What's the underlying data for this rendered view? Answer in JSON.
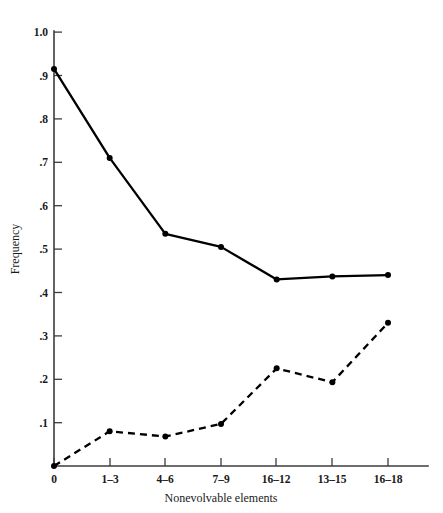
{
  "chart_data": {
    "type": "line",
    "title": "",
    "xlabel": "Nonevolvable elements",
    "ylabel": "Frequency",
    "categories": [
      "0",
      "1–3",
      "4–6",
      "7–9",
      "16–12",
      "13–15",
      "16–18"
    ],
    "x_tick_labels": [
      "0",
      "1–3",
      "4–6",
      "7–9",
      "16–12",
      "13–15",
      "16–18"
    ],
    "y_tick_labels": [
      "1.0",
      ".9",
      ".8",
      ".7",
      ".6",
      ".5",
      ".4",
      ".3",
      ".2",
      ".1"
    ],
    "y_tick_values": [
      1.0,
      0.9,
      0.8,
      0.7,
      0.6,
      0.5,
      0.4,
      0.3,
      0.2,
      0.1
    ],
    "ylim": [
      0,
      1.0
    ],
    "xlim": [
      0,
      6
    ],
    "grid": false,
    "legend": "none",
    "series": [
      {
        "name": "solid-series",
        "style": "solid",
        "marker": "filled-circle",
        "color": "#000000",
        "values": [
          0.915,
          0.71,
          0.535,
          0.505,
          0.43,
          0.437,
          0.44
        ]
      },
      {
        "name": "dashed-series",
        "style": "dashed",
        "marker": "filled-circle",
        "color": "#000000",
        "values": [
          0.0,
          0.08,
          0.068,
          0.097,
          0.225,
          0.193,
          0.33
        ]
      }
    ]
  },
  "figure": {
    "background_color": "#ffffff",
    "axis_color": "#3c3c3c",
    "line_color": "#000000"
  }
}
